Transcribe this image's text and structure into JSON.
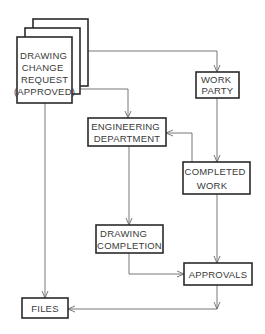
{
  "diagram": {
    "type": "flowchart",
    "colors": {
      "box_stroke": "#2a2a2a",
      "line": "#6a6a6a",
      "text": "#3a3a3a",
      "background": "#ffffff"
    },
    "nodes": {
      "dcr": {
        "lines": [
          "DRAWING",
          "CHANGE",
          "REQUEST",
          "(APPROVED)"
        ]
      },
      "work_party": {
        "lines": [
          "WORK",
          "PARTY"
        ]
      },
      "engineering": {
        "lines": [
          "ENGINEERING",
          "DEPARTMENT"
        ]
      },
      "completed_work": {
        "lines": [
          "COMPLETED",
          "WORK"
        ]
      },
      "drawing_completion": {
        "lines": [
          "DRAWING",
          "COMPLETION"
        ]
      },
      "approvals": {
        "lines": [
          "APPROVALS"
        ]
      },
      "files": {
        "lines": [
          "FILES"
        ]
      }
    },
    "edges": [
      {
        "from": "DRAWING CHANGE REQUEST (APPROVED)",
        "to": "WORK PARTY"
      },
      {
        "from": "DRAWING CHANGE REQUEST (APPROVED)",
        "to": "ENGINEERING DEPARTMENT"
      },
      {
        "from": "DRAWING CHANGE REQUEST (APPROVED)",
        "to": "FILES"
      },
      {
        "from": "WORK PARTY",
        "to": "COMPLETED WORK"
      },
      {
        "from": "COMPLETED WORK",
        "to": "ENGINEERING DEPARTMENT"
      },
      {
        "from": "ENGINEERING DEPARTMENT",
        "to": "DRAWING COMPLETION"
      },
      {
        "from": "COMPLETED WORK",
        "to": "APPROVALS"
      },
      {
        "from": "DRAWING COMPLETION",
        "to": "APPROVALS"
      },
      {
        "from": "APPROVALS",
        "to": "FILES"
      }
    ]
  }
}
